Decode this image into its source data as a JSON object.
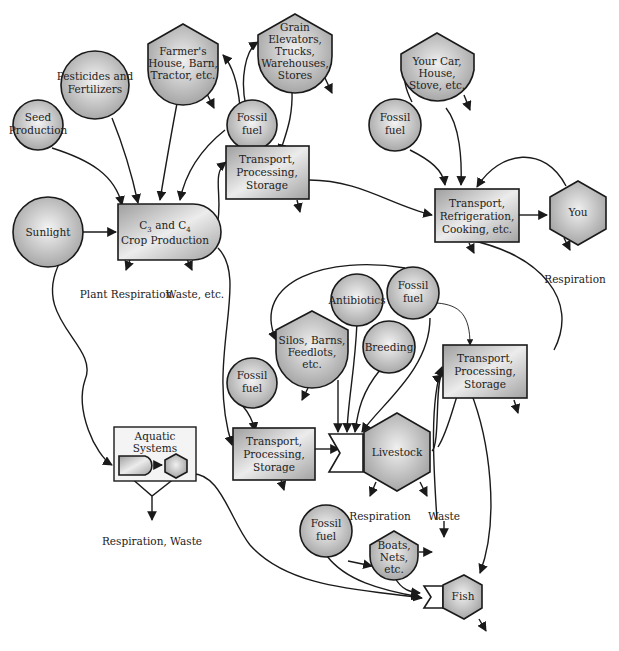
{
  "diagram": {
    "colors": {
      "node_fill_light": "#eeeeee",
      "node_fill_dark": "#a9a9a9",
      "stroke": "#1a1a1a",
      "background": "#ffffff"
    },
    "nodes": {
      "seed": {
        "type": "source-circle",
        "lines": [
          "Seed",
          "Production"
        ]
      },
      "pesticides": {
        "type": "source-circle",
        "lines": [
          "Pesticides and",
          "Fertilizers"
        ]
      },
      "farmer": {
        "type": "storage-shield",
        "lines": [
          "Farmer's",
          "House, Barn,",
          "Tractor, etc."
        ]
      },
      "fossil1": {
        "type": "source-circle",
        "lines": [
          "Fossil",
          "fuel"
        ]
      },
      "grain": {
        "type": "storage-shield",
        "lines": [
          "Grain",
          "Elevators,",
          "Trucks,",
          "Warehouses,",
          "Stores"
        ]
      },
      "yourcar": {
        "type": "storage-shield",
        "lines": [
          "Your Car,",
          "House,",
          "Stove, etc."
        ]
      },
      "fossil2": {
        "type": "source-circle",
        "lines": [
          "Fossil",
          "fuel"
        ]
      },
      "sunlight": {
        "type": "source-circle",
        "lines": [
          "Sunlight"
        ]
      },
      "crop": {
        "type": "producer",
        "line1_base": "C",
        "line1_sub1": "3",
        "line1_mid": " and C",
        "line1_sub2": "4",
        "line2": "Crop Production"
      },
      "tps1": {
        "type": "process-box",
        "lines": [
          "Transport,",
          "Processing,",
          "Storage"
        ]
      },
      "trc": {
        "type": "process-box",
        "lines": [
          "Transport,",
          "Refrigeration,",
          "Cooking, etc."
        ]
      },
      "you": {
        "type": "consumer-hexagon",
        "lines": [
          "You"
        ]
      },
      "antibiotics": {
        "type": "source-circle",
        "lines": [
          "Antibiotics"
        ]
      },
      "fossil3": {
        "type": "source-circle",
        "lines": [
          "Fossil",
          "fuel"
        ]
      },
      "silos": {
        "type": "storage-shield",
        "lines": [
          "Silos, Barns,",
          "Feedlots,",
          "etc."
        ]
      },
      "breeding": {
        "type": "source-circle",
        "lines": [
          "Breeding"
        ]
      },
      "tps3": {
        "type": "process-box",
        "lines": [
          "Transport,",
          "Processing,",
          "Storage"
        ]
      },
      "fossil4": {
        "type": "source-circle",
        "lines": [
          "Fossil",
          "fuel"
        ]
      },
      "tps2": {
        "type": "process-box",
        "lines": [
          "Transport,",
          "Processing,",
          "Storage"
        ]
      },
      "livestock": {
        "type": "consumer-hexagon",
        "lines": [
          "Livestock"
        ]
      },
      "aquatic": {
        "type": "subsystem-box",
        "lines": [
          "Aquatic",
          "Systems"
        ]
      },
      "fossil5": {
        "type": "source-circle",
        "lines": [
          "Fossil",
          "fuel"
        ]
      },
      "boats": {
        "type": "storage-shield",
        "lines": [
          "Boats,",
          "Nets,",
          "etc."
        ]
      },
      "fish": {
        "type": "consumer-hexagon",
        "lines": [
          "Fish"
        ]
      }
    },
    "captions": {
      "plant_respiration": "Plant Respiration",
      "waste_etc": "Waste, etc.",
      "you_respiration": "Respiration",
      "aquatic_loss": "Respiration, Waste",
      "livestock_respiration": "Respiration",
      "livestock_waste": "Waste"
    }
  }
}
